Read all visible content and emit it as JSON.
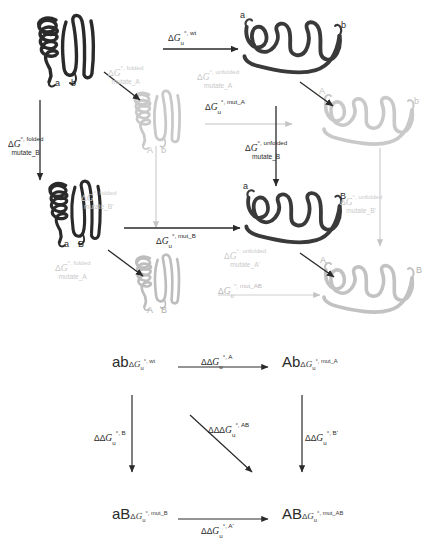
{
  "figure": {
    "colors": {
      "dark": "#2a2a2a",
      "light_grey": "#c9c9c9",
      "mid_grey": "#b9b9b9",
      "background": "#ffffff"
    }
  },
  "symbols": {
    "delta": "Δ",
    "degree_comma": "°,",
    "G": "G",
    "u": "u"
  },
  "top_panel": {
    "structures": [
      {
        "id": "folded-wt",
        "state": "folded",
        "color": "dark",
        "termini": [
          "a",
          "b"
        ]
      },
      {
        "id": "folded-mutA",
        "state": "folded",
        "color": "grey",
        "termini": [
          "A",
          "b"
        ]
      },
      {
        "id": "folded-mutB",
        "state": "folded",
        "color": "dark",
        "termini": [
          "a",
          "B"
        ]
      },
      {
        "id": "folded-mutAB",
        "state": "folded",
        "color": "grey",
        "termini": [
          "A",
          "B"
        ]
      },
      {
        "id": "unfolded-wt",
        "state": "unfolded",
        "color": "dark",
        "termini": [
          "a",
          "b"
        ]
      },
      {
        "id": "unfolded-mutA",
        "state": "unfolded",
        "color": "grey",
        "termini": [
          "A",
          "b"
        ]
      },
      {
        "id": "unfolded-mutB",
        "state": "unfolded",
        "color": "dark",
        "termini": [
          "a",
          "B"
        ]
      },
      {
        "id": "unfolded-mutAB",
        "state": "unfolded",
        "color": "grey",
        "termini": [
          "A",
          "B"
        ]
      }
    ],
    "arrows": [
      {
        "id": "unfold-wt",
        "name": "unfolding-wt-arrow",
        "color": "dark",
        "label_line1_prefix": "Δ",
        "label_G": "G",
        "label_sub": "u",
        "label_sup": "°, wt",
        "label_line2": ""
      },
      {
        "id": "mutateA-folded",
        "name": "mutate-a-folded-arrow",
        "color": "dark",
        "label_line1_prefix": "Δ",
        "label_G": "G",
        "label_sub": "",
        "label_sup": "°, folded",
        "label_line2": "mutate_A"
      },
      {
        "id": "mutateB-folded",
        "name": "mutate-b-folded-arrow",
        "color": "dark",
        "label_line1_prefix": "Δ",
        "label_G": "G",
        "label_sub": "",
        "label_sup": "°, folded",
        "label_line2": "mutate_B"
      },
      {
        "id": "mutateA-unfolded",
        "name": "mutate-a-unfolded-arrow",
        "color": "grey",
        "label_line1_prefix": "Δ",
        "label_G": "G",
        "label_sub": "",
        "label_sup": "°, unfolded",
        "label_line2": "mutate_A"
      },
      {
        "id": "mutateB-unfolded",
        "name": "mutate-b-unfolded-arrow",
        "color": "dark",
        "label_line1_prefix": "Δ",
        "label_G": "G",
        "label_sub": "",
        "label_sup": "°, unfolded",
        "label_line2": "mutate_B"
      },
      {
        "id": "unfold-mutA",
        "name": "unfolding-mut-a-arrow",
        "color": "grey",
        "label_line1_prefix": "Δ",
        "label_G": "G",
        "label_sub": "u",
        "label_sup": "°, mut_A",
        "label_line2": ""
      },
      {
        "id": "unfold-mutB",
        "name": "unfolding-mut-b-arrow",
        "color": "dark",
        "label_line1_prefix": "Δ",
        "label_G": "G",
        "label_sub": "u",
        "label_sup": "°, mut_B",
        "label_line2": ""
      },
      {
        "id": "unfold-mutAB",
        "name": "unfolding-mut-ab-arrow",
        "color": "grey",
        "label_line1_prefix": "Δ",
        "label_G": "G",
        "label_sub": "u",
        "label_sup": "°, mut_AB",
        "label_line2": ""
      },
      {
        "id": "mutateBprime-folded",
        "name": "mutate-b-prime-folded-arrow",
        "color": "grey",
        "label_line1_prefix": "Δ",
        "label_G": "G",
        "label_sub": "",
        "label_sup": "°, folded",
        "label_line2": "mutate_B'"
      },
      {
        "id": "mutateBprime-unfolded",
        "name": "mutate-b-prime-unfolded-arrow",
        "color": "grey",
        "label_line1_prefix": "Δ",
        "label_G": "G",
        "label_sub": "",
        "label_sup": "°, unfolded",
        "label_line2": "mutate_B'"
      },
      {
        "id": "mutateAprime-folded",
        "name": "mutate-a-prime-folded-arrow",
        "color": "grey",
        "label_line1_prefix": "Δ",
        "label_G": "G",
        "label_sub": "",
        "label_sup": "°, folded",
        "label_line2": "mutate_A"
      },
      {
        "id": "mutateAprime-unfolded",
        "name": "mutate-a-prime-unfolded-arrow",
        "color": "grey",
        "label_line1_prefix": "Δ",
        "label_G": "G",
        "label_sub": "",
        "label_sup": "°, unfolded",
        "label_line2": "mutate_A'"
      }
    ]
  },
  "bottom_panel": {
    "nodes": [
      {
        "id": "ab",
        "name": "cycle-node-ab",
        "letters": "ab",
        "dg_prefix": "Δ",
        "dg_G": "G",
        "dg_sub": "u",
        "dg_sup": "°, wt"
      },
      {
        "id": "Ab",
        "name": "cycle-node-Ab",
        "letters": "Ab",
        "dg_prefix": "Δ",
        "dg_G": "G",
        "dg_sub": "u",
        "dg_sup": "°, mut_A"
      },
      {
        "id": "aB",
        "name": "cycle-node-aB",
        "letters": "aB",
        "dg_prefix": "Δ",
        "dg_G": "G",
        "dg_sub": "u",
        "dg_sup": "°, mut_B"
      },
      {
        "id": "AB",
        "name": "cycle-node-AB",
        "letters": "AB",
        "dg_prefix": "Δ",
        "dg_G": "G",
        "dg_sub": "u",
        "dg_sup": "°, mut_AB"
      }
    ],
    "edges": [
      {
        "id": "ddG-A",
        "name": "cycle-edge-top",
        "prefix": "ΔΔ",
        "G": "G",
        "sub": "u",
        "sup": "°, A"
      },
      {
        "id": "ddG-B",
        "name": "cycle-edge-left",
        "prefix": "ΔΔ",
        "G": "G",
        "sub": "u",
        "sup": "°, B"
      },
      {
        "id": "ddG-Bprime",
        "name": "cycle-edge-right",
        "prefix": "ΔΔ",
        "G": "G",
        "sub": "u",
        "sup": "°, B'"
      },
      {
        "id": "ddG-Aprime",
        "name": "cycle-edge-bottom",
        "prefix": "ΔΔ",
        "G": "G",
        "sub": "u",
        "sup": "°, A'"
      },
      {
        "id": "dddG-AB",
        "name": "cycle-edge-diagonal",
        "prefix": "ΔΔΔ",
        "G": "G",
        "sub": "u",
        "sup": "°, AB"
      }
    ]
  }
}
